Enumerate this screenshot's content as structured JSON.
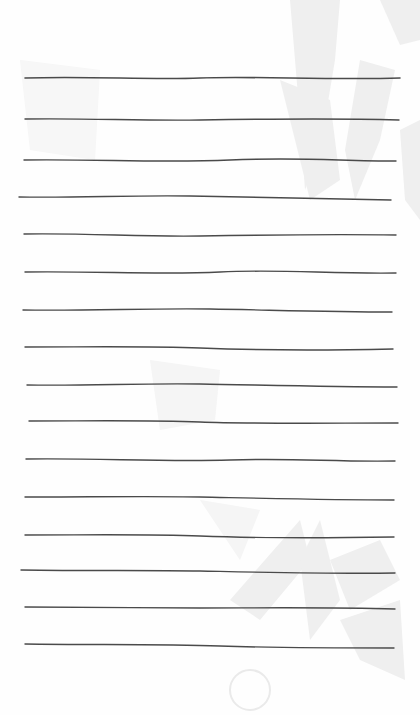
{
  "page": {
    "type": "lined stationery",
    "background": "#fefefe",
    "line_color": "#4a4a4a",
    "watermark_color": "#ececec",
    "line_count": 16,
    "lines": [
      {
        "y": 78,
        "x1": 25,
        "x2": 400
      },
      {
        "y": 119,
        "x1": 25,
        "x2": 399
      },
      {
        "y": 161,
        "x1": 24,
        "x2": 396
      },
      {
        "y": 198,
        "x1": 19,
        "x2": 391
      },
      {
        "y": 236,
        "x1": 24,
        "x2": 396
      },
      {
        "y": 273,
        "x1": 25,
        "x2": 396
      },
      {
        "y": 311,
        "x1": 23,
        "x2": 392
      },
      {
        "y": 348,
        "x1": 25,
        "x2": 393
      },
      {
        "y": 386,
        "x1": 27,
        "x2": 397
      },
      {
        "y": 423,
        "x1": 29,
        "x2": 398
      },
      {
        "y": 460,
        "x1": 26,
        "x2": 395
      },
      {
        "y": 498,
        "x1": 25,
        "x2": 394
      },
      {
        "y": 536,
        "x1": 25,
        "x2": 394
      },
      {
        "y": 571,
        "x1": 21,
        "x2": 395
      },
      {
        "y": 608,
        "x1": 25,
        "x2": 395
      },
      {
        "y": 646,
        "x1": 25,
        "x2": 394
      }
    ]
  }
}
